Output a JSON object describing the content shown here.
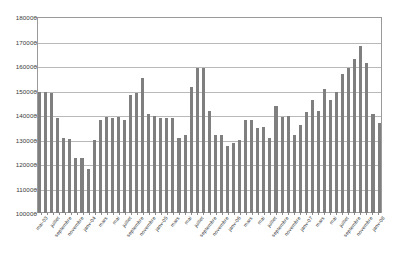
{
  "chart_data": {
    "type": "bar",
    "title": "",
    "subtitle": "",
    "xlabel": "",
    "ylabel": "",
    "ylim": [
      100000,
      180000
    ],
    "ytick_step": 10000,
    "yticks": [
      100000,
      110000,
      120000,
      130000,
      140000,
      150000,
      160000,
      170000,
      180000
    ],
    "ytick_labels": [
      "100000",
      "110000",
      "120000",
      "130000",
      "140000",
      "150000",
      "160000",
      "170000",
      "180000"
    ],
    "grid": true,
    "legend": "none",
    "bar_color": "#7f7f7f",
    "series_name": "",
    "categories": [
      "mai-03",
      "juin",
      "juillet",
      "août",
      "septembre",
      "octobre",
      "novembre",
      "décembre",
      "janv-04",
      "février",
      "mars",
      "avril",
      "mai",
      "juin",
      "juillet",
      "août",
      "septembre",
      "octobre",
      "novembre",
      "décembre",
      "janv-05",
      "février",
      "mars",
      "avril",
      "mai",
      "juin",
      "juillet",
      "août",
      "septembre",
      "octobre",
      "novembre",
      "décembre",
      "janv-06",
      "février",
      "mars",
      "avril",
      "mai",
      "juin",
      "juillet",
      "août",
      "septembre",
      "octobre",
      "novembre",
      "décembre",
      "janv-07",
      "février",
      "mars",
      "avril",
      "mai",
      "juin",
      "juillet",
      "août",
      "septembre",
      "octobre",
      "novembre",
      "décembre",
      "janv-08"
    ],
    "visible_tick_labels": [
      "mai-03",
      "juillet",
      "septembre",
      "novembre",
      "janv-04",
      "mars",
      "mai",
      "juillet",
      "septembre",
      "novembre",
      "janv-05",
      "mars",
      "mai",
      "juillet",
      "septembre",
      "novembre",
      "janv-06",
      "mars",
      "mai",
      "juillet",
      "septembre",
      "novembre",
      "janv-07",
      "mars",
      "mai",
      "juillet",
      "septembre",
      "novembre"
    ],
    "values": [
      150000,
      150000,
      149500,
      139000,
      131000,
      130500,
      122500,
      122500,
      118000,
      130000,
      138500,
      139500,
      139000,
      139500,
      138500,
      148500,
      149500,
      155500,
      141000,
      140000,
      139000,
      139000,
      139000,
      131000,
      132000,
      152000,
      160000,
      160000,
      142000,
      132000,
      132000,
      127500,
      129000,
      130000,
      138500,
      138500,
      135000,
      135500,
      131000,
      144000,
      139500,
      140000,
      132000,
      136500,
      141500,
      146500,
      142000,
      151000,
      146500,
      150000,
      157500,
      160000,
      163500,
      169000,
      162000,
      141000,
      137000
    ]
  }
}
